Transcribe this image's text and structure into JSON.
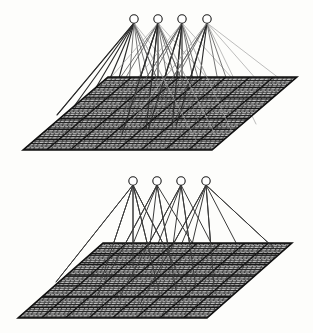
{
  "figure": {
    "background_color": "#fdfdfb",
    "ink_color": "#1b1b1b",
    "mid_ink_color": "#6d6d6d",
    "light_ink_color": "#a8a8a8",
    "node_fill": "#ffffff",
    "panel_count": 2
  },
  "panels": [
    {
      "id": "upper",
      "label": "upper-network-diagram",
      "node_count": 4,
      "node_radius": 4.2,
      "node_row_y": 19,
      "node_xs": [
        134,
        158,
        182,
        207
      ],
      "plane": {
        "label": "upper-grid-plane",
        "top_left_x": 108,
        "top_left_y": 77,
        "top_right_x": 297,
        "top_right_y": 77,
        "bottom_right_x": 212,
        "bottom_right_y": 150,
        "bottom_left_x": 23,
        "bottom_left_y": 150,
        "cols": 8,
        "rows": 7,
        "texture": "dense-cross-hatch",
        "fill": "#b9b9b9"
      },
      "connection_density": "dense",
      "connection_count": 44,
      "fan_spread": "wide",
      "line_weights": [
        "heavy",
        "medium",
        "light"
      ]
    },
    {
      "id": "lower",
      "label": "lower-network-diagram",
      "node_count": 4,
      "node_radius": 4.2,
      "node_row_y": 181,
      "node_xs": [
        133,
        157,
        181,
        206
      ],
      "plane": {
        "label": "lower-grid-plane",
        "top_left_x": 103,
        "top_left_y": 243,
        "top_right_x": 292,
        "top_right_y": 243,
        "bottom_right_x": 207,
        "bottom_right_y": 318,
        "bottom_left_x": 18,
        "bottom_left_y": 318,
        "cols": 8,
        "rows": 7,
        "texture": "dense-cross-hatch",
        "fill": "#b9b9b9"
      },
      "connection_density": "sparse",
      "connection_count": 24,
      "fan_spread": "narrow",
      "line_weights": [
        "medium",
        "light"
      ]
    }
  ]
}
